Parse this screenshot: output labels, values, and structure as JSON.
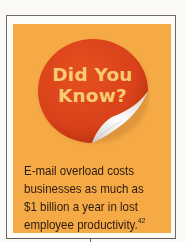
{
  "callout": {
    "badge": {
      "line1": "Did You",
      "line2": "Know?"
    },
    "fact": {
      "lines": [
        "E-mail overload costs",
        "businesses as much as",
        "$1 billion a year in lost",
        "employee productivity."
      ],
      "footnote": "42"
    },
    "colors": {
      "panel": "#f5aa45",
      "sticker": "#e0441a",
      "sticker_text": "#f7cc72",
      "text": "#2a1a10",
      "border": "#6e6a66"
    }
  }
}
